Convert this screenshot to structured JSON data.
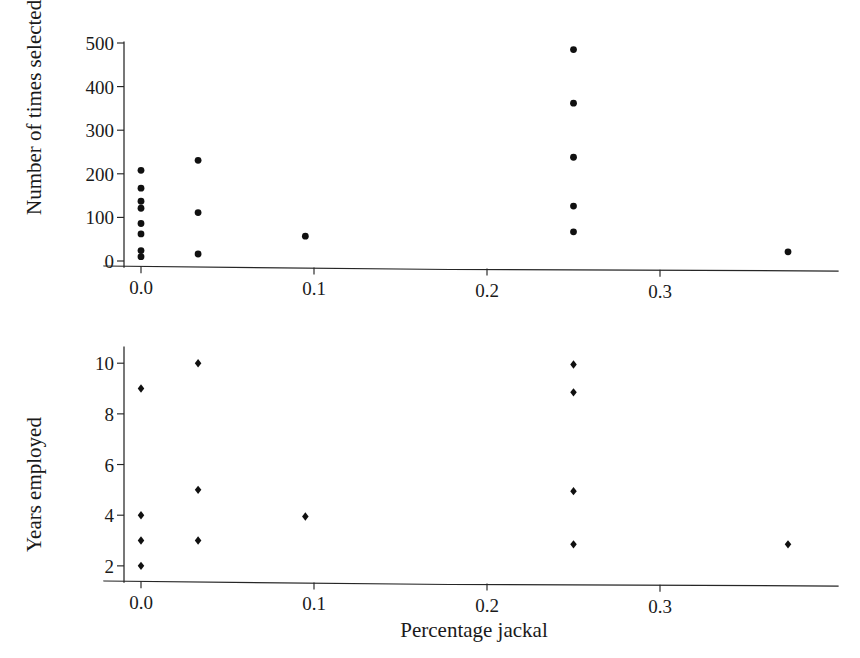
{
  "figure": {
    "width": 860,
    "height": 658,
    "background": "#ffffff",
    "ink_color": "#1a1a1a"
  },
  "chart_data": [
    {
      "id": "top-panel",
      "type": "scatter",
      "title": "",
      "xlabel": "",
      "ylabel": "Number of times selected",
      "xlim": [
        -0.022,
        0.415
      ],
      "ylim": [
        0,
        500
      ],
      "xticks": [
        0.0,
        0.1,
        0.2,
        0.3
      ],
      "xticklabels": [
        "0.0",
        "0.1",
        "0.2",
        "0.3"
      ],
      "yticks": [
        0,
        100,
        200,
        300,
        400,
        500
      ],
      "yticklabels": [
        "0",
        "100",
        "200",
        "300",
        "400",
        "500"
      ],
      "grid": false,
      "legend": false,
      "marker": "filled-circle",
      "marker_color": "#101010",
      "points": [
        {
          "x": 0.0,
          "y": 208
        },
        {
          "x": 0.0,
          "y": 167
        },
        {
          "x": 0.0,
          "y": 137
        },
        {
          "x": 0.0,
          "y": 121
        },
        {
          "x": 0.0,
          "y": 86
        },
        {
          "x": 0.0,
          "y": 62
        },
        {
          "x": 0.0,
          "y": 24
        },
        {
          "x": 0.0,
          "y": 10
        },
        {
          "x": 0.033,
          "y": 231
        },
        {
          "x": 0.033,
          "y": 111
        },
        {
          "x": 0.033,
          "y": 16
        },
        {
          "x": 0.095,
          "y": 57
        },
        {
          "x": 0.25,
          "y": 485
        },
        {
          "x": 0.25,
          "y": 362
        },
        {
          "x": 0.25,
          "y": 238
        },
        {
          "x": 0.25,
          "y": 126
        },
        {
          "x": 0.25,
          "y": 67
        },
        {
          "x": 0.374,
          "y": 21
        }
      ]
    },
    {
      "id": "bottom-panel",
      "type": "scatter",
      "title": "",
      "xlabel": "Percentage jackal",
      "ylabel": "Years employed",
      "xlim": [
        -0.022,
        0.415
      ],
      "ylim": [
        1.6,
        10.6
      ],
      "xticks": [
        0.0,
        0.1,
        0.2,
        0.3
      ],
      "xticklabels": [
        "0.0",
        "0.1",
        "0.2",
        "0.3"
      ],
      "yticks": [
        2,
        4,
        6,
        8,
        10
      ],
      "yticklabels": [
        "2",
        "4",
        "6",
        "8",
        "10"
      ],
      "grid": false,
      "legend": false,
      "marker": "filled-diamond",
      "marker_color": "#101010",
      "points": [
        {
          "x": 0.0,
          "y": 9
        },
        {
          "x": 0.0,
          "y": 4
        },
        {
          "x": 0.0,
          "y": 3
        },
        {
          "x": 0.0,
          "y": 2
        },
        {
          "x": 0.033,
          "y": 10
        },
        {
          "x": 0.033,
          "y": 5
        },
        {
          "x": 0.033,
          "y": 3
        },
        {
          "x": 0.095,
          "y": 3.95
        },
        {
          "x": 0.25,
          "y": 9.95
        },
        {
          "x": 0.25,
          "y": 8.85
        },
        {
          "x": 0.25,
          "y": 4.95
        },
        {
          "x": 0.25,
          "y": 2.85
        },
        {
          "x": 0.374,
          "y": 2.85
        }
      ]
    }
  ]
}
